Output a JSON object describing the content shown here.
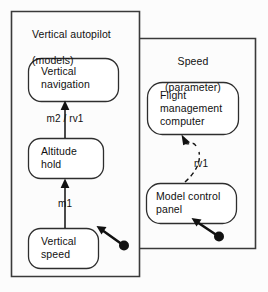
{
  "diagram": {
    "type": "uml-state-diagram",
    "background_color": "#fcfcfc",
    "line_color": "#111111",
    "regions": [
      {
        "id": "vertical-autopilot",
        "title": "Vertical autopilot\n(models)",
        "title_line1": "Vertical autopilot",
        "title_line2": "(models)",
        "align": "left"
      },
      {
        "id": "speed",
        "title": "Speed\n(parameter)",
        "title_line1": "Speed",
        "title_line2": "(parameter)",
        "align": "center"
      }
    ],
    "states": [
      {
        "id": "vertical-navigation",
        "label": "Vertical\nnavigation",
        "region": "vertical-autopilot"
      },
      {
        "id": "altitude-hold",
        "label": "Altitude\nhold",
        "region": "vertical-autopilot"
      },
      {
        "id": "vertical-speed",
        "label": "Vertical\nspeed",
        "region": "vertical-autopilot"
      },
      {
        "id": "flight-management-computer",
        "label": "Flight\nmanagement\ncomputer",
        "region": "speed"
      },
      {
        "id": "model-control-panel",
        "label": "Model control\npanel",
        "region": "speed"
      }
    ],
    "transitions": [
      {
        "id": "altitude-hold-to-vertical-navigation",
        "label": "m2 / rv1",
        "from": "altitude-hold",
        "to": "vertical-navigation",
        "style": "solid-arrow"
      },
      {
        "id": "vertical-speed-to-altitude-hold",
        "label": "m1",
        "from": "vertical-speed",
        "to": "altitude-hold",
        "style": "solid-arrow"
      },
      {
        "id": "model-control-panel-to-flight-management-computer",
        "label": "rv1",
        "from": "model-control-panel",
        "to": "flight-management-computer",
        "style": "dashed-arrow"
      }
    ],
    "connectors": [
      {
        "id": "vertical-speed-ball-connector",
        "target": "vertical-speed",
        "style": "ball-and-arrow"
      },
      {
        "id": "model-control-panel-ball-connector",
        "target": "model-control-panel",
        "style": "ball-and-arrow"
      }
    ]
  }
}
